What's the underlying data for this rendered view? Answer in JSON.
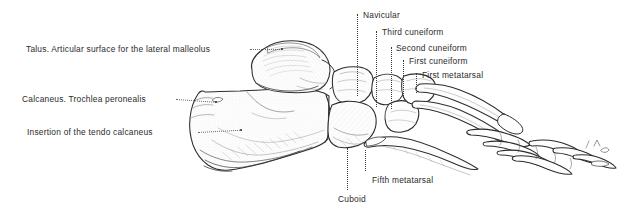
{
  "figure": {
    "background_color": "#ffffff",
    "text_color": "#2b2b2b",
    "line_color": "#3a3a3a",
    "width": 628,
    "height": 215
  },
  "labels": {
    "talus": "Talus. Articular surface for the lateral malleolus",
    "calcaneus_trochlea": "Calcaneus. Trochlea peronealis",
    "tendo_calcaneus": "Insertion of the tendo calcaneus",
    "navicular": "Navicular",
    "third_cuneiform": "Third cuneiform",
    "second_cuneiform": "Second cuneiform",
    "first_cuneiform": "First cuneiform",
    "first_metatarsal": "First metatarsal",
    "fifth_metatarsal": "Fifth metatarsal",
    "cuboid": "Cuboid"
  },
  "annotations": [
    {
      "id": "talus",
      "side": "left",
      "leader": "horizontal-dotted",
      "target_x": 282,
      "target_y": 49
    },
    {
      "id": "calcaneus_trochlea",
      "side": "left",
      "leader": "horizontal-dotted",
      "target_x": 215,
      "target_y": 103
    },
    {
      "id": "tendo_calcaneus",
      "side": "left",
      "leader": "horizontal-dotted",
      "target_x": 240,
      "target_y": 131
    },
    {
      "id": "navicular",
      "side": "top",
      "leader": "vertical-dotted",
      "target_x": 357,
      "target_y": 95
    },
    {
      "id": "third_cuneiform",
      "side": "top",
      "leader": "vertical-dotted",
      "target_x": 376,
      "target_y": 105
    },
    {
      "id": "second_cuneiform",
      "side": "top",
      "leader": "vertical-dotted",
      "target_x": 391,
      "target_y": 95
    },
    {
      "id": "first_cuneiform",
      "side": "top",
      "leader": "vertical-dotted",
      "target_x": 402,
      "target_y": 95
    },
    {
      "id": "first_metatarsal",
      "side": "top",
      "leader": "vertical-dotted",
      "target_x": 414,
      "target_y": 92
    },
    {
      "id": "fifth_metatarsal",
      "side": "bottom",
      "leader": "vertical-dotted",
      "target_x": 365,
      "target_y": 150
    },
    {
      "id": "cuboid",
      "side": "bottom",
      "leader": "vertical-dotted",
      "target_x": 347,
      "target_y": 148
    }
  ],
  "bones": [
    {
      "name": "talus",
      "label": "Talus"
    },
    {
      "name": "calcaneus",
      "label": "Calcaneus"
    },
    {
      "name": "navicular",
      "label": "Navicular"
    },
    {
      "name": "cuboid",
      "label": "Cuboid"
    },
    {
      "name": "first-cuneiform",
      "label": "First cuneiform"
    },
    {
      "name": "second-cuneiform",
      "label": "Second cuneiform"
    },
    {
      "name": "third-cuneiform",
      "label": "Third cuneiform"
    },
    {
      "name": "first-metatarsal",
      "label": "First metatarsal"
    },
    {
      "name": "fifth-metatarsal",
      "label": "Fifth metatarsal"
    },
    {
      "name": "phalanges",
      "label": "Phalanges"
    }
  ]
}
